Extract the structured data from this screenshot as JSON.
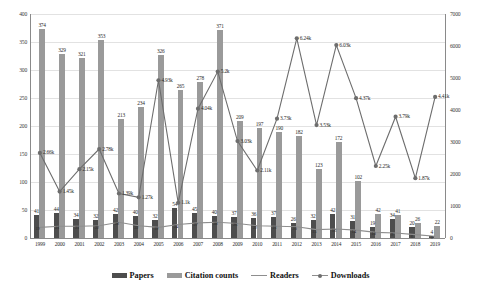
{
  "chart_data": {
    "type": "bar",
    "title": "",
    "xlabel": "",
    "ylabel": "",
    "ylim": [
      0,
      400
    ],
    "y2lim": [
      0,
      7000
    ],
    "grid": true,
    "legend_position": "bottom",
    "categories": [
      "1999",
      "2000",
      "2001",
      "2002",
      "2003",
      "2004",
      "2005",
      "2006",
      "2007",
      "2008",
      "2009",
      "2010",
      "2011",
      "2012",
      "2013",
      "2014",
      "2015",
      "2016",
      "2017",
      "2018",
      "2019"
    ],
    "yticks": [
      "0",
      "50",
      "100",
      "150",
      "200",
      "250",
      "300",
      "350",
      "400"
    ],
    "y2ticks": [
      "0",
      "1000",
      "2000",
      "3000",
      "4000",
      "5000",
      "6000",
      "7000"
    ],
    "series": [
      {
        "name": "Papers",
        "type": "bar",
        "axis": "left",
        "color": "#4d4d4d",
        "values": [
          41,
          44,
          34,
          32,
          42,
          40,
          32,
          54,
          45,
          40,
          37,
          36,
          37,
          26,
          32,
          42,
          31,
          19,
          34,
          20,
          4
        ],
        "labels": [
          "41",
          "44",
          "34",
          "32",
          "42",
          "40",
          "32",
          "54",
          "45",
          "40",
          "37",
          "36",
          "37",
          "26",
          "32",
          "42",
          "31",
          "19",
          "34",
          "20",
          "4"
        ]
      },
      {
        "name": "Citation counts",
        "type": "bar",
        "axis": "left",
        "color": "#9a9a9a",
        "values": [
          374,
          329,
          321,
          353,
          213,
          234,
          326,
          265,
          278,
          371,
          209,
          197,
          190,
          182,
          123,
          172,
          102,
          42,
          41,
          26,
          22
        ],
        "labels": [
          "374",
          "329",
          "321",
          "353",
          "213",
          "234",
          "326",
          "265",
          "278",
          "371",
          "209",
          "197",
          "190",
          "182",
          "123",
          "172",
          "102",
          "42",
          "41",
          "26",
          "22"
        ]
      },
      {
        "name": "Readers",
        "type": "line",
        "axis": "left",
        "color": "#8e8e8e",
        "values": [
          19,
          21,
          21,
          22,
          28,
          22,
          19,
          24,
          27,
          28,
          26,
          22,
          21,
          20,
          15,
          16,
          14,
          10,
          9,
          6,
          3
        ],
        "labels": [
          "19",
          "21",
          "21",
          "22",
          "28",
          "22",
          "19",
          "24",
          "27",
          "28",
          "26",
          "22",
          "21",
          "20",
          "15",
          "16",
          "14",
          "10",
          "9",
          "6",
          "3"
        ]
      },
      {
        "name": "Downloads",
        "type": "line",
        "axis": "right",
        "color": "#6d6d6d",
        "values": [
          2660,
          1450,
          2150,
          2780,
          1390,
          1270,
          4930,
          1100,
          4040,
          5200,
          3030,
          2110,
          3730,
          6240,
          3530,
          6030,
          4370,
          2250,
          3790,
          1870,
          4410
        ],
        "labels": [
          "2.66k",
          "1.45k",
          "2.15k",
          "2.78k",
          "1.39k",
          "1.27k",
          "4.93k",
          "1.1k",
          "4.04k",
          "5.2k",
          "3.03k",
          "2.11k",
          "3.73k",
          "6.24k",
          "3.53k",
          "6.03k",
          "4.37k",
          "2.25k",
          "3.79k",
          "1.87k",
          "4.41k"
        ]
      }
    ]
  },
  "legend": {
    "items": [
      {
        "label": "Papers",
        "marker": "dark-square-swatch"
      },
      {
        "label": "Citation counts",
        "marker": "light-square-swatch"
      },
      {
        "label": "Readers",
        "marker": "line-swatch"
      },
      {
        "label": "Downloads",
        "marker": "line-dot-swatch"
      }
    ]
  }
}
